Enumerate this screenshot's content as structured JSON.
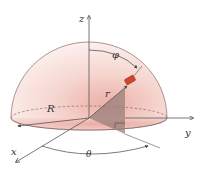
{
  "figure": {
    "labels": {
      "z_axis": "z",
      "y_axis": "y",
      "x_axis": "x",
      "radius_R": "R",
      "radius_r": "r",
      "angle_phi": "φ",
      "angle_theta": "θ"
    },
    "colors": {
      "dome_fill_light": "#fbeeee",
      "dome_fill_dark": "#eeb5ad",
      "triangle_fill": "#9a7e7a",
      "object_fill": "#d0452a",
      "axis_color": "#555555"
    }
  }
}
